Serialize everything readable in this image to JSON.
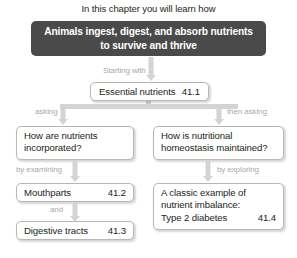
{
  "header": {
    "text": "In this chapter you will learn how"
  },
  "banner": {
    "line1": "Animals ingest, digest, and absorb nutrients",
    "line2": "to survive and thrive",
    "color": "#4b4a4a",
    "text_color": "#ffffff"
  },
  "connectors": {
    "starting_with": "Starting with",
    "asking": "asking",
    "then_asking": "then asking",
    "by_examining": "by examining",
    "by_exploring": "by exploring",
    "and": "and",
    "color": "#d6d4d2",
    "label_color": "#aaa8a6"
  },
  "nodes": {
    "essential": {
      "label": "Essential nutrients",
      "number": "41.1"
    },
    "question_left": {
      "line1": "How are nutrients",
      "line2": "incorporated?"
    },
    "question_right": {
      "line1": "How is nutritional",
      "line2": "homeostasis maintained?"
    },
    "mouthparts": {
      "label": "Mouthparts",
      "number": "41.2"
    },
    "digestive": {
      "label": "Digestive tracts",
      "number": "41.3"
    },
    "diabetes": {
      "line1": "A classic example of",
      "line2": "nutrient imbalance:",
      "label": "Type 2 diabetes",
      "number": "41.4"
    }
  }
}
